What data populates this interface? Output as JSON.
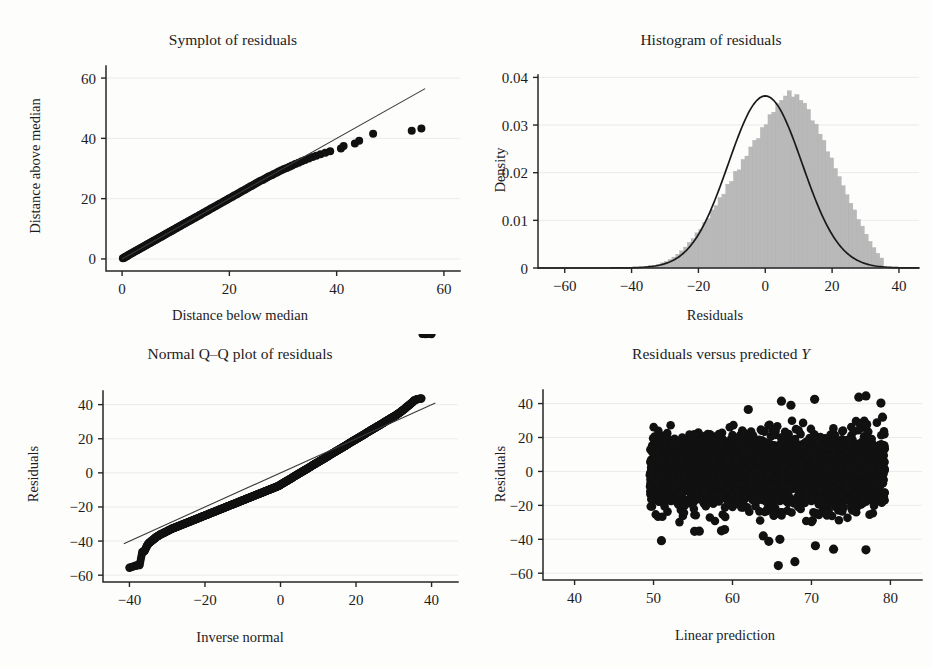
{
  "figure": {
    "background": "#fdfdfc",
    "marker_color": "#111111",
    "hist_fill": "#b9b9b9",
    "line_color": "#3a3a3a",
    "grid_color": "#e9e9ea",
    "panels": 4
  },
  "chart_data": [
    {
      "id": "symplot",
      "type": "scatter",
      "title": "Symplot of residuals",
      "xlabel": "Distance below median",
      "ylabel": "Distance above median",
      "xlim": [
        -3,
        63
      ],
      "ylim": [
        -4,
        64
      ],
      "xticks": [
        0,
        20,
        40,
        60
      ],
      "yticks": [
        0,
        20,
        40,
        60
      ],
      "grid": true,
      "gridlines_y": [
        0,
        20,
        40,
        60
      ],
      "reference_line": {
        "x": [
          0,
          56.5
        ],
        "y": [
          0,
          56.5
        ],
        "label": "y = x"
      },
      "points_x": [
        0.15,
        0.3,
        0.45,
        0.6,
        0.8,
        0.95,
        1.1,
        1.3,
        1.5,
        1.7,
        1.9,
        2.1,
        2.3,
        2.5,
        2.7,
        2.9,
        3.1,
        3.3,
        3.5,
        3.7,
        3.9,
        4.1,
        4.3,
        4.5,
        4.7,
        4.9,
        5.1,
        5.3,
        5.5,
        5.7,
        5.9,
        6.1,
        6.3,
        6.5,
        6.7,
        6.9,
        7.1,
        7.3,
        7.5,
        7.7,
        7.9,
        8.1,
        8.3,
        8.6,
        8.8,
        9.0,
        9.2,
        9.4,
        9.6,
        9.9,
        10.1,
        10.3,
        10.6,
        10.8,
        11.0,
        11.3,
        11.5,
        11.8,
        12.0,
        12.3,
        12.5,
        12.8,
        13.0,
        13.3,
        13.6,
        13.8,
        14.1,
        14.4,
        14.6,
        14.9,
        15.2,
        15.5,
        15.8,
        16.0,
        16.3,
        16.6,
        16.9,
        17.2,
        17.5,
        17.8,
        18.1,
        18.4,
        18.8,
        19.1,
        19.4,
        19.7,
        20.0,
        20.4,
        20.7,
        21.0,
        21.4,
        21.7,
        22.1,
        22.4,
        22.8,
        23.1,
        23.5,
        23.9,
        24.2,
        24.6,
        25.0,
        25.4,
        25.8,
        26.2,
        26.6,
        27.0,
        27.4,
        27.9,
        28.3,
        28.8,
        29.2,
        29.7,
        30.2,
        30.7,
        31.2,
        31.7,
        32.3,
        32.9,
        33.5,
        34.1,
        34.8,
        35.5,
        36.2,
        37.0,
        37.9,
        38.8,
        40.8,
        41.3,
        43.4,
        44.2,
        46.8,
        54.0,
        55.8
      ],
      "points_y": [
        0.2,
        0.35,
        0.5,
        0.7,
        0.85,
        1.0,
        1.2,
        1.4,
        1.6,
        1.8,
        2.0,
        2.2,
        2.4,
        2.6,
        2.8,
        3.0,
        3.2,
        3.4,
        3.6,
        3.8,
        4.0,
        4.2,
        4.4,
        4.6,
        4.8,
        5.0,
        5.2,
        5.4,
        5.6,
        5.8,
        6.0,
        6.2,
        6.4,
        6.6,
        6.8,
        7.0,
        7.2,
        7.4,
        7.6,
        7.8,
        8.0,
        8.2,
        8.4,
        8.7,
        8.9,
        9.1,
        9.3,
        9.5,
        9.7,
        10.0,
        10.2,
        10.4,
        10.7,
        10.9,
        11.1,
        11.4,
        11.6,
        11.9,
        12.1,
        12.4,
        12.6,
        12.9,
        13.1,
        13.4,
        13.7,
        13.9,
        14.2,
        14.5,
        14.7,
        15.0,
        15.3,
        15.6,
        15.9,
        16.1,
        16.4,
        16.7,
        17.0,
        17.3,
        17.6,
        17.9,
        18.2,
        18.5,
        18.9,
        19.2,
        19.5,
        19.8,
        20.1,
        20.5,
        20.8,
        21.1,
        21.5,
        21.8,
        22.2,
        22.5,
        22.9,
        23.2,
        23.6,
        24.0,
        24.3,
        24.7,
        25.1,
        25.5,
        25.9,
        26.2,
        26.6,
        27.0,
        27.4,
        27.8,
        28.2,
        28.6,
        29.0,
        29.4,
        29.8,
        30.2,
        30.6,
        31.0,
        31.5,
        31.9,
        32.4,
        32.8,
        33.3,
        33.8,
        34.2,
        34.7,
        35.2,
        35.7,
        36.6,
        37.5,
        38.3,
        39.2,
        41.5,
        42.5,
        43.3
      ]
    },
    {
      "id": "histogram",
      "type": "histogram",
      "title": "Histogram of residuals",
      "xlabel": "Residuals",
      "ylabel": "Density",
      "xlim": [
        -68,
        46
      ],
      "ylim": [
        0,
        0.0405
      ],
      "xticks": [
        -60,
        -40,
        -20,
        0,
        20,
        40
      ],
      "xticklabels": [
        "−60",
        "−40",
        "−20",
        "0",
        "20",
        "40"
      ],
      "yticks": [
        0,
        0.01,
        0.02,
        0.03,
        0.04
      ],
      "yticklabels": [
        "0",
        "0.01",
        "0.02",
        "0.03",
        "0.04"
      ],
      "grid": true,
      "bin_width": 1.15,
      "bin_start": -36,
      "bin_count": 62,
      "bin_heights": [
        0.0003,
        0.0005,
        0.0006,
        0.0008,
        0.0011,
        0.0014,
        0.0018,
        0.0023,
        0.0029,
        0.0036,
        0.0044,
        0.0054,
        0.0062,
        0.0074,
        0.0081,
        0.0096,
        0.0104,
        0.0122,
        0.0131,
        0.0148,
        0.0155,
        0.0176,
        0.0182,
        0.0203,
        0.0206,
        0.0228,
        0.0235,
        0.0254,
        0.0268,
        0.0272,
        0.0295,
        0.0301,
        0.0322,
        0.0327,
        0.0345,
        0.0352,
        0.0361,
        0.0372,
        0.0359,
        0.0364,
        0.0352,
        0.0346,
        0.0333,
        0.0309,
        0.0302,
        0.0281,
        0.0268,
        0.0244,
        0.0231,
        0.0209,
        0.0192,
        0.0173,
        0.0154,
        0.0136,
        0.0122,
        0.0102,
        0.0088,
        0.0071,
        0.0056,
        0.0043,
        0.0031,
        0.0021
      ],
      "overlay_curve": {
        "label": "normal density",
        "mean": 0.0,
        "sd": 11.05,
        "peak": 0.0361
      }
    },
    {
      "id": "qq",
      "type": "scatter",
      "title": "Normal Q–Q plot of residuals",
      "xlabel": "Inverse normal",
      "ylabel": "Residuals",
      "xlim": [
        -47,
        47
      ],
      "ylim": [
        -64,
        48
      ],
      "xticks": [
        -40,
        -20,
        0,
        20,
        40
      ],
      "xticklabels": [
        "−40",
        "−20",
        "0",
        "20",
        "40"
      ],
      "yticks": [
        -60,
        -40,
        -20,
        0,
        20,
        40
      ],
      "yticklabels": [
        "−60",
        "−40",
        "−20",
        "0",
        "20",
        "40"
      ],
      "grid": true,
      "reference_line": {
        "x": [
          -41.5,
          41.0
        ],
        "y": [
          -41.5,
          41.0
        ],
        "label": "45 degree line"
      },
      "points_x": [
        -40.0,
        -38.4,
        -37.3,
        -36.6,
        -36.0,
        -35.4,
        -35.0,
        -34.5,
        -34.1,
        -33.6,
        -33.2,
        -32.8,
        -32.3,
        -31.9,
        -31.5,
        -31.0,
        -30.6,
        -30.1,
        -29.7,
        -29.2,
        -28.8,
        -28.3,
        -27.9,
        -27.4,
        -27.0,
        -26.5,
        -26.1,
        -25.6,
        -25.2,
        -24.7,
        -24.3,
        -23.8,
        -23.4,
        -22.9,
        -22.5,
        -22.0,
        -21.6,
        -21.1,
        -20.7,
        -20.2,
        -19.8,
        -19.3,
        -18.9,
        -18.4,
        -18.0,
        -17.5,
        -17.1,
        -16.6,
        -16.2,
        -15.7,
        -15.3,
        -14.8,
        -14.4,
        -13.9,
        -13.5,
        -13.0,
        -12.6,
        -12.1,
        -11.7,
        -11.2,
        -10.8,
        -10.3,
        -9.9,
        -9.4,
        -9.0,
        -8.5,
        -8.1,
        -7.6,
        -7.2,
        -6.7,
        -6.3,
        -5.8,
        -5.4,
        -4.9,
        -4.5,
        -4.0,
        -3.6,
        -3.1,
        -2.7,
        -2.2,
        -1.8,
        -1.3,
        -0.9,
        -0.4,
        0.0,
        0.4,
        0.9,
        1.3,
        1.8,
        2.2,
        2.7,
        3.1,
        3.6,
        4.0,
        4.5,
        4.9,
        5.4,
        5.8,
        6.3,
        6.7,
        7.2,
        7.6,
        8.1,
        8.5,
        9.0,
        9.4,
        9.9,
        10.3,
        10.8,
        11.2,
        11.7,
        12.1,
        12.6,
        13.0,
        13.5,
        13.9,
        14.4,
        14.8,
        15.3,
        15.7,
        16.2,
        16.6,
        17.1,
        17.5,
        18.0,
        18.4,
        18.9,
        19.3,
        19.8,
        20.2,
        20.7,
        21.1,
        21.6,
        22.0,
        22.5,
        22.9,
        23.4,
        23.8,
        24.3,
        24.7,
        25.2,
        25.6,
        26.1,
        26.5,
        27.0,
        27.4,
        27.9,
        28.3,
        28.8,
        29.2,
        29.7,
        30.1,
        30.6,
        31.0,
        31.5,
        31.9,
        32.3,
        32.8,
        33.2,
        33.6,
        34.1,
        34.5,
        35.0,
        35.4,
        36.0,
        36.6,
        37.3,
        38.4,
        40.0
      ],
      "points_y": [
        -55.6,
        -54.5,
        -54.0,
        -46.5,
        -45.8,
        -43.0,
        -41.5,
        -40.6,
        -39.8,
        -39.0,
        -38.2,
        -37.5,
        -36.9,
        -36.3,
        -35.8,
        -35.3,
        -34.8,
        -34.3,
        -33.8,
        -33.3,
        -32.8,
        -32.4,
        -32.0,
        -31.6,
        -31.2,
        -30.8,
        -30.4,
        -30.0,
        -29.6,
        -29.2,
        -28.8,
        -28.4,
        -28.0,
        -27.6,
        -27.2,
        -26.8,
        -26.4,
        -26.0,
        -25.6,
        -25.2,
        -24.8,
        -24.4,
        -24.0,
        -23.6,
        -23.2,
        -22.8,
        -22.4,
        -22.0,
        -21.6,
        -21.2,
        -20.8,
        -20.4,
        -20.0,
        -19.6,
        -19.2,
        -18.8,
        -18.4,
        -18.0,
        -17.6,
        -17.2,
        -16.8,
        -16.4,
        -16.0,
        -15.6,
        -15.2,
        -14.8,
        -14.4,
        -14.0,
        -13.6,
        -13.2,
        -12.8,
        -12.4,
        -12.0,
        -11.6,
        -11.2,
        -10.8,
        -10.4,
        -10.0,
        -9.6,
        -9.2,
        -8.8,
        -8.4,
        -8.0,
        -7.6,
        -7.0,
        -6.4,
        -5.8,
        -5.2,
        -4.6,
        -4.0,
        -3.4,
        -2.8,
        -2.2,
        -1.6,
        -1.0,
        -0.4,
        0.2,
        0.8,
        1.4,
        2.0,
        2.6,
        3.2,
        3.8,
        4.4,
        5.0,
        5.6,
        6.2,
        6.8,
        7.4,
        8.0,
        8.6,
        9.2,
        9.8,
        10.4,
        11.0,
        11.6,
        12.2,
        12.8,
        13.4,
        14.0,
        14.6,
        15.2,
        15.8,
        16.4,
        17.0,
        17.6,
        18.2,
        18.8,
        19.4,
        20.0,
        20.6,
        21.2,
        21.8,
        22.4,
        23.0,
        23.6,
        24.2,
        24.8,
        25.4,
        26.0,
        26.6,
        27.2,
        27.8,
        28.4,
        29.0,
        29.6,
        30.2,
        30.8,
        31.4,
        32.0,
        32.6,
        33.2,
        33.8,
        34.5,
        35.2,
        35.9,
        36.6,
        37.4,
        38.2,
        39.0,
        39.8,
        40.6,
        41.5,
        42.5,
        43.0,
        43.4,
        43.6
      ]
    },
    {
      "id": "residuals-vs-fitted",
      "type": "scatter",
      "title": "Residuals versus predicted Y",
      "title_italic_tail": "Y",
      "xlabel": "Linear prediction",
      "ylabel": "Residuals",
      "xlim": [
        36,
        84
      ],
      "ylim": [
        -64,
        48
      ],
      "xticks": [
        40,
        50,
        60,
        70,
        80
      ],
      "yticks": [
        -60,
        -40,
        -20,
        0,
        20,
        40
      ],
      "yticklabels": [
        "−60",
        "−40",
        "−20",
        "0",
        "20",
        "40"
      ],
      "grid": true,
      "cloud": {
        "x_range": [
          49.5,
          79.3
        ],
        "y_core_range": [
          -25,
          28
        ],
        "n_points": 2600,
        "y_sd": 11.0,
        "description": "dense black band of residuals between x=49.5 and x=79.3, core spans roughly -25 to +28 with scattered outliers to -56 and +45"
      },
      "outliers_x": [
        51.0,
        55.2,
        55.8,
        58.6,
        59.0,
        63.9,
        64.6,
        65.8,
        66.0,
        67.9,
        70.5,
        72.8,
        76.9,
        62.0,
        66.2,
        67.4,
        70.4,
        76.0,
        76.9,
        78.8,
        79.0
      ],
      "outliers_y": [
        -40.8,
        -35.3,
        -35.2,
        -35.0,
        -34.3,
        -38.0,
        -41.2,
        -55.5,
        -40.0,
        -53.2,
        -43.8,
        -45.8,
        -46.2,
        36.5,
        41.4,
        39.0,
        42.5,
        43.8,
        44.5,
        40.3,
        32.0
      ]
    }
  ]
}
